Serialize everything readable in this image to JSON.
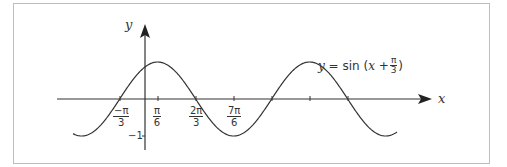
{
  "chart_data": {
    "type": "line",
    "title": "",
    "function": "y = sin(x + π/3)",
    "xlabel": "x",
    "ylabel": "y",
    "annotation": {
      "lhs": "y",
      "eq": "=",
      "fn": "sin",
      "open": "(",
      "var": "x",
      "plus": "+",
      "num": "π",
      "den": "3",
      "close": ")"
    },
    "x_ticks": [
      {
        "num": "−π",
        "den": "3"
      },
      {
        "num": "π",
        "den": "6"
      },
      {
        "num": "2π",
        "den": "3"
      },
      {
        "num": "7π",
        "den": "6"
      }
    ],
    "y_ticks": [
      "−1"
    ],
    "key_points": [
      {
        "x": "-π/3",
        "y": 0
      },
      {
        "x": "π/6",
        "y": 1
      },
      {
        "x": "2π/3",
        "y": 0
      },
      {
        "x": "7π/6",
        "y": -1
      },
      {
        "x": "5π/3",
        "y": 0
      },
      {
        "x": "13π/6",
        "y": 1
      },
      {
        "x": "8π/3",
        "y": 0
      }
    ],
    "grid": false,
    "colors": {
      "line": "#333333",
      "frame": "#bdbdbd"
    }
  }
}
